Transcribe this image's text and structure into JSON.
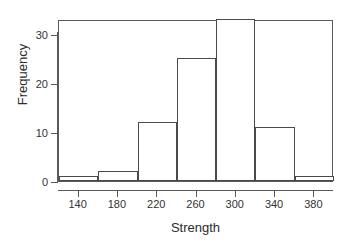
{
  "chart_data": {
    "type": "bar",
    "title": "",
    "subtitle": "",
    "xlabel": "Strength",
    "ylabel": "Frequency",
    "categories": [
      "120-160",
      "160-200",
      "200-240",
      "240-280",
      "280-320",
      "320-360",
      "360-400"
    ],
    "bin_edges": [
      120,
      160,
      200,
      240,
      280,
      320,
      360,
      400
    ],
    "values": [
      1,
      2,
      12,
      25,
      33,
      11,
      1
    ],
    "bin_width": 40,
    "xlim": [
      120,
      400
    ],
    "ylim": [
      0,
      33
    ],
    "x_ticks": [
      140,
      180,
      220,
      260,
      300,
      340,
      380
    ],
    "y_ticks": [
      0,
      10,
      20,
      30
    ],
    "x_tick_labels": [
      "140",
      "180",
      "220",
      "260",
      "300",
      "340",
      "380"
    ],
    "y_tick_labels": [
      "0",
      "10",
      "20",
      "30"
    ],
    "grid": false,
    "legend": false,
    "legend_position": "none",
    "bar_fill": "#ffffff",
    "bar_border": "#4a4a4a",
    "axis_color": "#5a5a5a",
    "background": "#ffffff",
    "annotations": []
  }
}
